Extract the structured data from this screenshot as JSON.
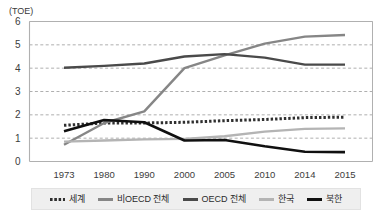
{
  "chart_data": {
    "type": "line",
    "title": "",
    "subtitle": "",
    "unit_label": "(TOE)",
    "xlabel": "",
    "ylabel": "",
    "grid": true,
    "grid_style": "horizontal-dashed",
    "legend_position": "bottom",
    "ylim": [
      0,
      6
    ],
    "yticks": [
      0,
      1,
      2,
      3,
      4,
      5,
      6
    ],
    "ytick_labels": [
      "0",
      "1",
      "2",
      "3",
      "4",
      "5",
      "6"
    ],
    "categories": [
      "1973",
      "1980",
      "1990",
      "2000",
      "2005",
      "2010",
      "2014",
      "2015"
    ],
    "x": [
      1973,
      1980,
      1990,
      2000,
      2005,
      2010,
      2014,
      2015
    ],
    "series": [
      {
        "name": "세계",
        "style": "dotted",
        "color": "#2f2f2f",
        "width": 3,
        "values": [
          1.55,
          1.65,
          1.65,
          1.68,
          1.75,
          1.8,
          1.88,
          1.9
        ]
      },
      {
        "name": "비OECD 전체",
        "style": "solid",
        "color": "#868686",
        "width": 2.4,
        "values": [
          0.72,
          1.65,
          2.15,
          4.0,
          4.55,
          5.05,
          5.35,
          5.42
        ]
      },
      {
        "name": "OECD 전체",
        "style": "solid",
        "color": "#4a4a4a",
        "width": 2.4,
        "values": [
          4.02,
          4.1,
          4.2,
          4.5,
          4.6,
          4.45,
          4.15,
          4.15
        ]
      },
      {
        "name": "한국",
        "style": "solid",
        "color": "#b4b4b4",
        "width": 2.4,
        "values": [
          0.85,
          0.9,
          0.95,
          0.97,
          1.08,
          1.28,
          1.4,
          1.42
        ]
      },
      {
        "name": "북한",
        "style": "solid",
        "color": "#101010",
        "width": 2.6,
        "values": [
          1.3,
          1.78,
          1.68,
          0.9,
          0.92,
          0.65,
          0.42,
          0.4
        ]
      }
    ]
  },
  "legend": {
    "items": [
      {
        "label": "세계"
      },
      {
        "label": "비OECD 전체"
      },
      {
        "label": "OECD 전체"
      },
      {
        "label": "한국"
      },
      {
        "label": "북한"
      }
    ]
  },
  "colors": {
    "plot_border": "#b0b0b0",
    "gridline": "#9a9a9a",
    "legend_background": "#efefef",
    "page_background": "#ffffff",
    "tick_text": "#3c3c3c"
  }
}
